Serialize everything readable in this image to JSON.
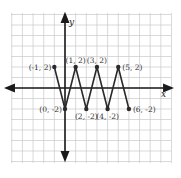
{
  "chart_data": {
    "type": "line",
    "title": "",
    "xlabel": "x",
    "ylabel": "y",
    "grid": true,
    "xlim": [
      -5,
      10
    ],
    "ylim": [
      -7,
      7
    ],
    "points": [
      {
        "x": -1,
        "y": 2,
        "label": "(-1, 2)"
      },
      {
        "x": 0,
        "y": -2,
        "label": "(0, -2)"
      },
      {
        "x": 1,
        "y": 2,
        "label": "(1, 2)"
      },
      {
        "x": 2,
        "y": -2,
        "label": "(2, -2)"
      },
      {
        "x": 3,
        "y": 2,
        "label": "(3, 2)"
      },
      {
        "x": 4,
        "y": -2,
        "label": "(4, -2)"
      },
      {
        "x": 5,
        "y": 2,
        "label": "(5, 2)"
      },
      {
        "x": 6,
        "y": -2,
        "label": "(6, -2)"
      }
    ],
    "series": [
      {
        "name": "zigzag",
        "x": [
          -1,
          0,
          1,
          2,
          3,
          4,
          5,
          6
        ],
        "y": [
          2,
          -2,
          2,
          -2,
          2,
          -2,
          2,
          -2
        ]
      }
    ]
  },
  "colors": {
    "grid": "#c8c8c8",
    "axis": "#1a1a1a",
    "line": "#2a2a2a",
    "point": "#2a2a2a"
  }
}
